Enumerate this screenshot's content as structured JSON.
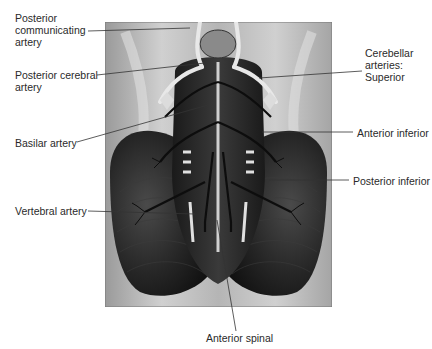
{
  "figure": {
    "labels": {
      "posterior_communicating": "Posterior\ncommunicating\nartery",
      "posterior_cerebral": "Posterior cerebral\nartery",
      "basilar": "Basilar artery",
      "vertebral": "Vertebral artery",
      "cerebellar_heading": "Cerebellar\narteries:\nSuperior",
      "anterior_inferior": "Anterior inferior",
      "posterior_inferior": "Posterior inferior",
      "anterior_spinal": "Anterior spinal"
    },
    "colors": {
      "background": "#ffffff",
      "plate_light": "#bdbdbd",
      "tissue_dark": "#1c1c1c",
      "vessel": "#111111",
      "highlight": "#e6e6e6",
      "leader": "#333333"
    }
  }
}
